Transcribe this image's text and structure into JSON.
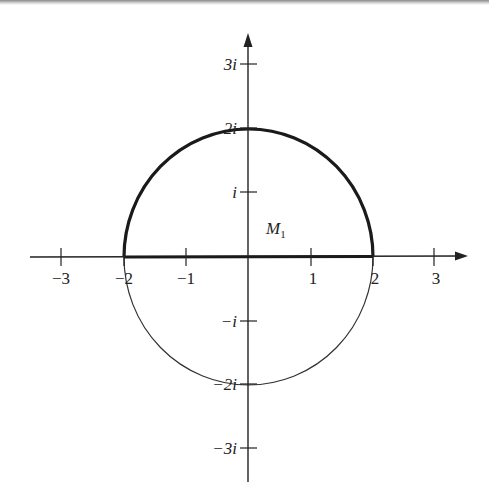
{
  "figure": {
    "region_label": "M",
    "region_subscript": "1",
    "x_ticks": [
      {
        "value": -3,
        "label": "−3",
        "px": 61
      },
      {
        "value": -2,
        "label": "−2",
        "px": 124
      },
      {
        "value": -1,
        "label": "−1",
        "px": 186
      },
      {
        "value": 1,
        "label": "1",
        "px": 311
      },
      {
        "value": 2,
        "label": "2",
        "px": 373
      },
      {
        "value": 3,
        "label": "3",
        "px": 434
      }
    ],
    "y_ticks": [
      {
        "value": 3,
        "label": "3i",
        "px": 64
      },
      {
        "value": 2,
        "label": "2i",
        "px": 128
      },
      {
        "value": 1,
        "label": "i",
        "px": 192
      },
      {
        "value": -1,
        "label": "−i",
        "px": 321
      },
      {
        "value": -2,
        "label": "−2i",
        "px": 384
      },
      {
        "value": -3,
        "label": "−3i",
        "px": 448
      }
    ],
    "circle": {
      "center": [
        0,
        0
      ],
      "radius": 2
    },
    "colors": {
      "axis": "#222222",
      "bold_curve": "#1a1a1a",
      "thin_curve": "#333333",
      "background": "#ffffff"
    }
  }
}
